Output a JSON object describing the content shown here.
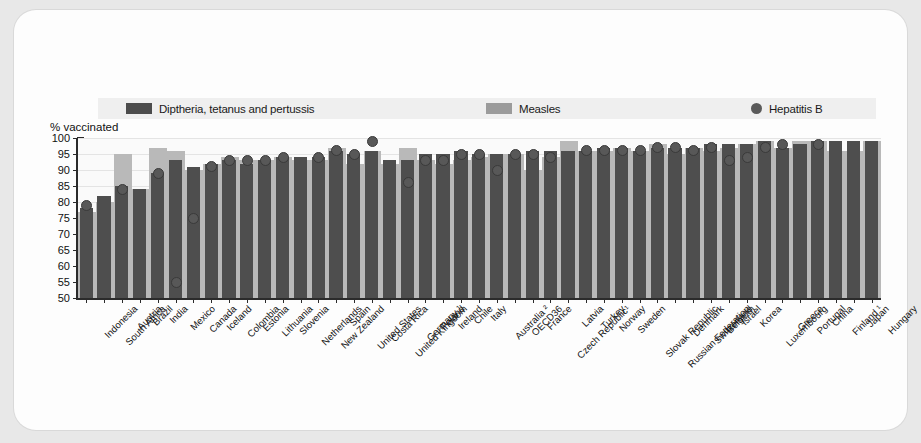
{
  "chart_data": {
    "type": "bar",
    "title": "",
    "subtitle": "",
    "xlabel": "",
    "ylabel": "% vaccinated",
    "ylim": [
      50,
      100
    ],
    "yticks": [
      50,
      55,
      60,
      65,
      70,
      75,
      80,
      85,
      90,
      95,
      100
    ],
    "grid": true,
    "legend_position": "top",
    "categories": [
      "Indonesia",
      "South Africa",
      "Austria",
      "Brazil",
      "India",
      "Mexico",
      "Canada",
      "Iceland",
      "Colombia",
      "Estonia",
      "Lithuania",
      "Slovenia",
      "Netherlands",
      "New Zealand",
      "Spain",
      "United States",
      "Costa Rica",
      "United Kingdom",
      "Germany ¹",
      "Poland",
      "Ireland",
      "Chile",
      "Italy",
      "Australia ²",
      "OECD36",
      "France",
      "Czech Republic¹",
      "Latvia",
      "Turkey",
      "Norway",
      "Sweden",
      "Slovak Republic",
      "Russian Federation",
      "Denmark",
      "Switzerland",
      "Belgium",
      "Israel",
      "Korea",
      "Luxembourg",
      "Greece",
      "Portugal",
      "China",
      "Finland ¹",
      "Japan",
      "Hungary"
    ],
    "series": [
      {
        "name": "Diptheria, tetanus and pertussis",
        "color": "#4e4e4e",
        "values": [
          78,
          82,
          85,
          84,
          89,
          93,
          91,
          92,
          93,
          92,
          93,
          94,
          94,
          94,
          96,
          95,
          96,
          93,
          93,
          95,
          95,
          96,
          95,
          95,
          95,
          96,
          96,
          96,
          96,
          97,
          97,
          96,
          97,
          97,
          97,
          98,
          98,
          98,
          99,
          97,
          98,
          99,
          99,
          99,
          99
        ]
      },
      {
        "name": "Measles",
        "color": "#b9b9b9",
        "values": [
          77,
          80,
          95,
          84,
          97,
          96,
          90,
          92,
          94,
          93,
          93,
          94,
          93,
          93,
          97,
          92,
          96,
          92,
          97,
          93,
          92,
          93,
          94,
          95,
          95,
          90,
          94,
          99,
          96,
          96,
          97,
          96,
          98,
          95,
          97,
          96,
          97,
          98,
          99,
          97,
          99,
          99,
          96,
          96,
          99
        ]
      }
    ],
    "hepatitis_b": {
      "name": "Hepatitis B",
      "color": "#585858",
      "values": [
        79,
        null,
        84,
        null,
        89,
        55,
        75,
        91,
        93,
        93,
        93,
        94,
        null,
        94,
        96,
        95,
        99,
        null,
        86,
        93,
        93,
        95,
        95,
        90,
        95,
        95,
        94,
        null,
        96,
        96,
        96,
        96,
        97,
        97,
        96,
        97,
        93,
        94,
        97,
        98,
        null,
        98,
        null,
        null,
        null
      ]
    }
  },
  "legend": {
    "items": [
      {
        "label": "Diptheria, tetanus and pertussis",
        "type": "bar",
        "color": "#4e4e4e"
      },
      {
        "label": "Measles",
        "type": "bar",
        "color": "#b9b9b9"
      },
      {
        "label": "Hepatitis B",
        "type": "dot",
        "color": "#585858"
      }
    ]
  }
}
